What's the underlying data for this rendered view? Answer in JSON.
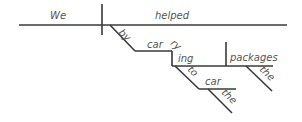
{
  "diagram": {
    "type": "sentence-diagram",
    "sentence": "We helped by carrying the packages to the car",
    "colors": {
      "line": "#3a3a3a",
      "text": "#555555",
      "background": "#ffffff"
    },
    "words": {
      "subject": "We",
      "verb": "helped",
      "preposition_1": "by",
      "gerund_part_1": "car",
      "gerund_part_2": "ry",
      "gerund_part_3": "ing",
      "direct_object": "packages",
      "article_1": "the",
      "preposition_2": "to",
      "object_of_preposition": "car",
      "article_2": "the"
    }
  }
}
